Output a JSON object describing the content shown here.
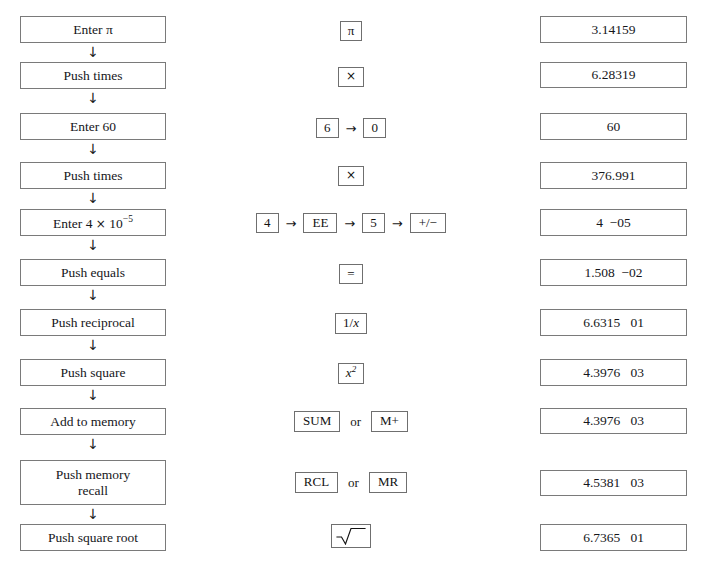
{
  "figure": {
    "columns": {
      "action": "Action",
      "keys": "Keys",
      "display": "Display"
    },
    "arrow_glyph": "↓",
    "sequence_arrow_glyph": "→",
    "or_label": "or",
    "border_color": "#7a7a7a",
    "background_color": "#ffffff",
    "text_color": "#15161a"
  },
  "rows": [
    {
      "action": "Enter π",
      "keys": [
        {
          "label": "π"
        }
      ],
      "display": "3.14159"
    },
    {
      "action": "Push times",
      "keys": [
        {
          "label": "×"
        }
      ],
      "display": "6.28319"
    },
    {
      "action": "Enter 60",
      "keys": [
        {
          "label": "6"
        },
        {
          "label": "0"
        }
      ],
      "display": "60"
    },
    {
      "action": "Push times",
      "keys": [
        {
          "label": "×"
        }
      ],
      "display": "376.991"
    },
    {
      "action": "Enter 4 × 10⁻⁵",
      "action_parts": {
        "prefix": "Enter 4 ",
        "times": "×",
        "base": " 10",
        "exponent": "−5"
      },
      "keys": [
        {
          "label": "4"
        },
        {
          "label": "EE"
        },
        {
          "label": "5"
        },
        {
          "label": "+/−"
        }
      ],
      "display": "4  −05"
    },
    {
      "action": "Push equals",
      "keys": [
        {
          "label": "="
        }
      ],
      "display": "1.508  −02"
    },
    {
      "action": "Push reciprocal",
      "keys": [
        {
          "label": "1/x"
        }
      ],
      "display": "6.6315   01"
    },
    {
      "action": "Push square",
      "keys": [
        {
          "label": "x²"
        }
      ],
      "display": "4.3976   03"
    },
    {
      "action": "Add to memory",
      "keys": [
        {
          "label": "SUM"
        },
        {
          "label": "M+"
        }
      ],
      "display": "4.3976   03"
    },
    {
      "action": "Push memory recall",
      "action_line1": "Push memory",
      "action_line2": "recall",
      "keys": [
        {
          "label": "RCL"
        },
        {
          "label": "MR"
        }
      ],
      "display": "4.5381   03"
    },
    {
      "action": "Push square root",
      "keys": [
        {
          "label": "√"
        }
      ],
      "display": "6.7365   01"
    }
  ]
}
